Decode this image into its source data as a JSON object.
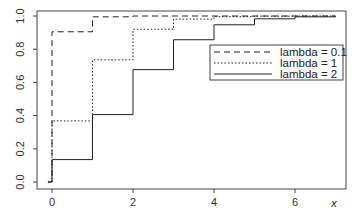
{
  "chart_data": {
    "type": "line",
    "step": true,
    "title": "",
    "xlabel": "x",
    "ylabel": "",
    "xlim": [
      -0.1,
      7
    ],
    "ylim": [
      0,
      1
    ],
    "x_ticks": [
      0,
      2,
      4,
      6
    ],
    "x_tick_labels": [
      "0",
      "2",
      "4",
      "6"
    ],
    "y_ticks": [
      0,
      0.2,
      0.4,
      0.6,
      0.8,
      1.0
    ],
    "y_tick_labels": [
      "0.0",
      "0.2",
      "0.4",
      "0.6",
      "0.8",
      "1.0"
    ],
    "grid": false,
    "legend_position": "top-right",
    "series": [
      {
        "name": "lambda = 0.1",
        "line_style": "dashed",
        "x": [
          0,
          1,
          2,
          3,
          4,
          5,
          6,
          7
        ],
        "values": [
          0.905,
          0.995,
          1.0,
          1.0,
          1.0,
          1.0,
          1.0,
          1.0
        ]
      },
      {
        "name": "lambda = 1",
        "line_style": "dotted",
        "x": [
          0,
          1,
          2,
          3,
          4,
          5,
          6,
          7
        ],
        "values": [
          0.368,
          0.736,
          0.92,
          0.981,
          0.996,
          0.999,
          1.0,
          1.0
        ]
      },
      {
        "name": "lambda = 2",
        "line_style": "solid",
        "x": [
          0,
          1,
          2,
          3,
          4,
          5,
          6,
          7
        ],
        "values": [
          0.135,
          0.406,
          0.677,
          0.857,
          0.947,
          0.983,
          0.995,
          0.999
        ]
      }
    ]
  }
}
